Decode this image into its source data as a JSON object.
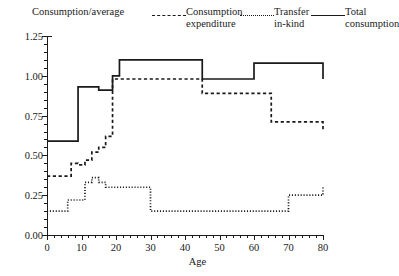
{
  "chart_data": {
    "type": "line",
    "title": "",
    "xlabel": "Age",
    "ylabel": "",
    "xlim": [
      0,
      80
    ],
    "ylim": [
      0.0,
      1.25
    ],
    "grid": false,
    "legend_position": "top",
    "x_ticks": [
      0,
      10,
      20,
      30,
      40,
      50,
      60,
      70,
      80
    ],
    "x_tick_labels": [
      "0",
      "10",
      "20",
      "30",
      "40",
      "50",
      "60",
      "70",
      "80"
    ],
    "x_minor_tick_step": 2,
    "y_ticks": [
      0.0,
      0.25,
      0.5,
      0.75,
      1.0,
      1.25
    ],
    "y_tick_labels": [
      "0.00",
      "0.25",
      "0.50",
      "0.75",
      "1.00",
      "1.25"
    ],
    "y_minor_tick_step": 0.05,
    "step_style": "post",
    "series": [
      {
        "name": "Consumption/average",
        "style": "none",
        "note": "axis/legend heading only, no plotted curve",
        "x": [],
        "values": []
      },
      {
        "name": "Consumption expenditure",
        "style": "dashed",
        "x": [
          0,
          5,
          7,
          9,
          11,
          13,
          15,
          17,
          19,
          30,
          45,
          60,
          65,
          80
        ],
        "values": [
          0.37,
          0.37,
          0.45,
          0.44,
          0.47,
          0.52,
          0.55,
          0.62,
          0.98,
          0.98,
          0.89,
          0.89,
          0.71,
          0.65
        ]
      },
      {
        "name": "Transfer in-kind",
        "style": "dotted",
        "x": [
          0,
          4,
          6,
          9,
          11,
          13,
          15,
          17,
          19,
          23,
          30,
          60,
          70,
          80
        ],
        "values": [
          0.15,
          0.15,
          0.22,
          0.22,
          0.33,
          0.36,
          0.33,
          0.3,
          0.3,
          0.3,
          0.15,
          0.15,
          0.25,
          0.31
        ]
      },
      {
        "name": "Total consumption",
        "style": "solid",
        "x": [
          0,
          7,
          9,
          13,
          15,
          17,
          19,
          21,
          30,
          45,
          60,
          65,
          80
        ],
        "values": [
          0.59,
          0.59,
          0.93,
          0.93,
          0.91,
          0.91,
          1.0,
          1.1,
          1.1,
          0.98,
          1.08,
          1.08,
          0.98
        ]
      }
    ]
  },
  "legend": {
    "items": [
      {
        "label": "Consumption/average",
        "swatch": "none"
      },
      {
        "label": "Consumption\nexpenditure",
        "swatch": "dashed"
      },
      {
        "label": "Transfer\nin-kind",
        "swatch": "dotted"
      },
      {
        "label": "Total\nconsumption",
        "swatch": "solid"
      }
    ]
  },
  "axes": {
    "x_title": "Age",
    "x_labels": [
      "0",
      "10",
      "20",
      "30",
      "40",
      "50",
      "60",
      "70",
      "80"
    ],
    "y_labels": [
      "0.00",
      "0.25",
      "0.50",
      "0.75",
      "1.00",
      "1.25"
    ]
  }
}
